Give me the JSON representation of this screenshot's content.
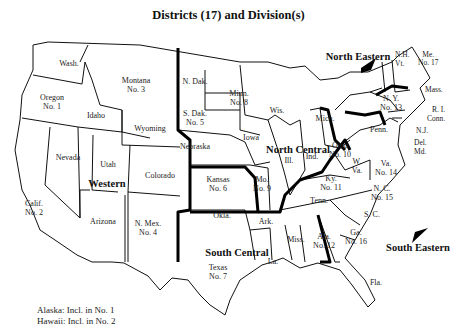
{
  "title": "Districts (17) and Division(s)",
  "states": {
    "wash": {
      "name": "Wash."
    },
    "oregon": {
      "name": "Oregon",
      "district": "No. 1"
    },
    "calif": {
      "name": "Calif.",
      "district": "No. 2"
    },
    "idaho": {
      "name": "Idaho"
    },
    "nevada": {
      "name": "Nevada"
    },
    "montana": {
      "name": "Montana",
      "district": "No. 3"
    },
    "wyoming": {
      "name": "Wyoming"
    },
    "utah": {
      "name": "Utah"
    },
    "colorado": {
      "name": "Colorado"
    },
    "arizona": {
      "name": "Arizona"
    },
    "nmex": {
      "name": "N. Mex.",
      "district": "No. 4"
    },
    "ndak": {
      "name": "N. Dak."
    },
    "sdak": {
      "name": "S. Dak.",
      "district": "No. 5"
    },
    "nebraska": {
      "name": "Nebraska"
    },
    "kansas": {
      "name": "Kansas",
      "district": "No. 6"
    },
    "okla": {
      "name": "Okla."
    },
    "texas": {
      "name": "Texas",
      "district": "No. 7"
    },
    "minn": {
      "name": "Minn.",
      "district": "No. 8"
    },
    "iowa": {
      "name": "Iowa"
    },
    "mo": {
      "name": "Mo.",
      "district": "No. 9"
    },
    "ark": {
      "name": "Ark."
    },
    "la": {
      "name": "La."
    },
    "wis": {
      "name": "Wis."
    },
    "ill": {
      "name": "Ill."
    },
    "mich": {
      "name": "Mich."
    },
    "ind": {
      "name": "Ind."
    },
    "ohio": {
      "name": "Ohio",
      "district": "No. 10"
    },
    "ky": {
      "name": "Ky.",
      "district": "No. 11"
    },
    "tenn": {
      "name": "Tenn."
    },
    "miss": {
      "name": "Miss."
    },
    "ala": {
      "name": "Ala.",
      "district": "No. 12"
    },
    "ga": {
      "name": "Ga.",
      "district": "No. 16"
    },
    "fla": {
      "name": "Fla."
    },
    "sc": {
      "name": "S. C."
    },
    "nc": {
      "name": "N. C.",
      "district": "No. 15"
    },
    "va": {
      "name": "Va.",
      "district": "No. 14"
    },
    "wva": {
      "name": "W. Va."
    },
    "penn": {
      "name": "Penn."
    },
    "ny": {
      "name": "N. Y.",
      "district": "No. 13"
    },
    "nh": {
      "name": "N.H."
    },
    "vt": {
      "name": "Vt."
    },
    "me": {
      "name": "Me.",
      "district": "No. 17"
    },
    "mass": {
      "name": "Mass."
    },
    "ri": {
      "name": "R. I."
    },
    "conn": {
      "name": "Conn."
    },
    "nj": {
      "name": "N.J."
    },
    "del": {
      "name": "Del."
    },
    "md": {
      "name": "Md."
    }
  },
  "divisions": {
    "western": "Western",
    "north_central": "North Central",
    "north_eastern": "North Eastern",
    "south_central": "South Central",
    "south_eastern": "South Eastern"
  },
  "footnotes": {
    "alaska": "Alaska: Incl. in No. 1",
    "hawaii": "Hawaii: Incl. in No. 2"
  }
}
